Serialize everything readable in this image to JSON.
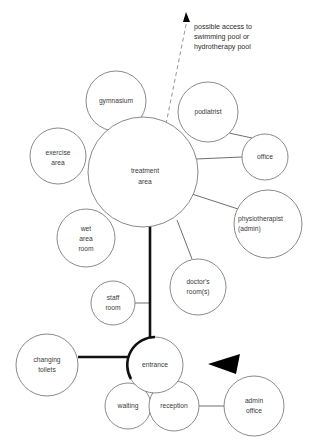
{
  "diagram": {
    "background_color": "#ffffff",
    "bubble_stroke_color": "#7d7d7d",
    "primary_link_color": "#111111",
    "label_color": "#3a3a3a",
    "annotation": {
      "line1": "possible access to",
      "line2": "swimming pool or",
      "line3": "hydrotherapy pool"
    },
    "nodes": [
      {
        "id": "treatment-area",
        "label_line1": "treatment",
        "label_line2": "area",
        "cx": 143,
        "cy": 172,
        "r": 55,
        "emphasis": "normal"
      },
      {
        "id": "gymnasium",
        "label_line1": "gymnasium",
        "label_line2": "",
        "cx": 116,
        "cy": 101,
        "r": 30,
        "emphasis": "normal"
      },
      {
        "id": "podiatrist",
        "label_line1": "podiatrist",
        "label_line2": "",
        "cx": 208,
        "cy": 112,
        "r": 30,
        "emphasis": "normal"
      },
      {
        "id": "exercise-area",
        "label_line1": "exercise",
        "label_line2": "area",
        "cx": 58,
        "cy": 156,
        "r": 28,
        "emphasis": "normal"
      },
      {
        "id": "office",
        "label_line1": "office",
        "label_line2": "",
        "cx": 265,
        "cy": 157,
        "r": 23,
        "emphasis": "normal"
      },
      {
        "id": "physiotherapist-admin",
        "label_line1": "physiotherapist",
        "label_line2": "(admin)",
        "cx": 268,
        "cy": 224,
        "r": 34,
        "emphasis": "normal"
      },
      {
        "id": "wet-area-room",
        "label_line1": "wet",
        "label_line2": "area",
        "label_line3": "room",
        "cx": 86,
        "cy": 238,
        "r": 29,
        "emphasis": "normal"
      },
      {
        "id": "doctors-rooms",
        "label_line1": "doctor's",
        "label_line2": "room(s)",
        "cx": 198,
        "cy": 287,
        "r": 28,
        "emphasis": "normal"
      },
      {
        "id": "staff-room",
        "label_line1": "staff",
        "label_line2": "room",
        "cx": 113,
        "cy": 303,
        "r": 22,
        "emphasis": "normal"
      },
      {
        "id": "changing-toilets",
        "label_line1": "changing",
        "label_line2": "toilets",
        "cx": 47,
        "cy": 365,
        "r": 31,
        "emphasis": "normal"
      },
      {
        "id": "entrance",
        "label_line1": "entrance",
        "label_line2": "",
        "cx": 155,
        "cy": 365,
        "r": 28,
        "emphasis": "thick"
      },
      {
        "id": "waiting",
        "label_line1": "waiting",
        "label_line2": "",
        "cx": 128,
        "cy": 406,
        "r": 23,
        "emphasis": "normal"
      },
      {
        "id": "reception",
        "label_line1": "reception",
        "label_line2": "",
        "cx": 174,
        "cy": 406,
        "r": 25,
        "emphasis": "normal"
      },
      {
        "id": "admin-office",
        "label_line1": "admin",
        "label_line2": "office",
        "cx": 254,
        "cy": 406,
        "r": 30,
        "emphasis": "normal"
      }
    ],
    "links": [
      {
        "id": "treatment-to-entrance",
        "from": "treatment-area",
        "to": "entrance",
        "style": "primary"
      },
      {
        "id": "entrance-to-changing",
        "from": "entrance",
        "to": "changing-toilets",
        "style": "primary"
      },
      {
        "id": "treatment-to-office",
        "from": "treatment-area",
        "to": "office",
        "style": "thin"
      },
      {
        "id": "podiatrist-to-office",
        "from": "podiatrist",
        "to": "office",
        "style": "thin"
      },
      {
        "id": "treatment-to-physio",
        "from": "treatment-area",
        "to": "physiotherapist-admin",
        "style": "thin"
      },
      {
        "id": "treatment-to-doctors",
        "from": "treatment-area",
        "to": "doctors-rooms",
        "style": "thin"
      },
      {
        "id": "staff-to-spine",
        "from": "staff-room",
        "to": "treatment-to-entrance",
        "style": "thin"
      },
      {
        "id": "reception-to-admin",
        "from": "reception",
        "to": "admin-office",
        "style": "thin"
      },
      {
        "id": "treatment-to-pool",
        "from": "treatment-area",
        "to": "pool-annotation",
        "style": "dashed"
      }
    ],
    "arrow": {
      "name": "main-entry-arrow",
      "direction": "left",
      "tip_x": 208,
      "tip_y": 364
    }
  }
}
